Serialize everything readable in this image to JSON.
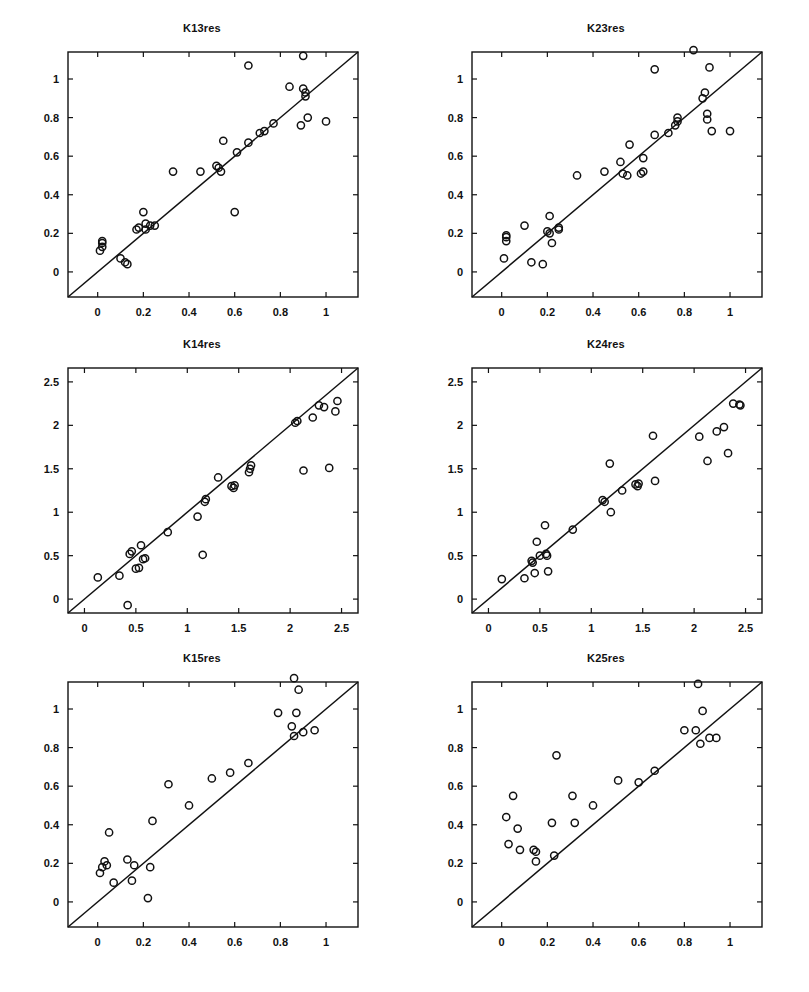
{
  "figure": {
    "width": 809,
    "height": 992,
    "background": "#ffffff",
    "marker_color": "#111111",
    "line_color": "#111111",
    "axis_color": "#111111",
    "rows": 3,
    "cols": 2
  },
  "chart_data": [
    {
      "type": "scatter",
      "title": "K13res",
      "xlabel": "",
      "ylabel": "",
      "xlim": [
        -0.13,
        1.14
      ],
      "ylim": [
        -0.13,
        1.14
      ],
      "xticks": [
        0,
        0.2,
        0.4,
        0.6,
        0.8,
        1
      ],
      "xticklabels": [
        "0",
        "0.2",
        "0.4",
        "0.6",
        "0.8",
        "1"
      ],
      "yticks": [
        0,
        0.2,
        0.4,
        0.6,
        0.8,
        1
      ],
      "yticklabels": [
        "0",
        "0.2",
        "0.4",
        "0.6",
        "0.8",
        "1"
      ],
      "grid": false,
      "legend": null,
      "reference_line": {
        "type": "identity",
        "from": [
          -0.13,
          -0.13
        ],
        "to": [
          1.14,
          1.14
        ]
      },
      "x": [
        0.01,
        0.02,
        0.02,
        0.02,
        0.1,
        0.12,
        0.13,
        0.17,
        0.18,
        0.2,
        0.21,
        0.21,
        0.23,
        0.25,
        0.33,
        0.45,
        0.52,
        0.53,
        0.54,
        0.55,
        0.6,
        0.61,
        0.66,
        0.66,
        0.71,
        0.73,
        0.77,
        0.84,
        0.89,
        0.9,
        0.9,
        0.91,
        0.91,
        0.92,
        1.0
      ],
      "y": [
        0.11,
        0.13,
        0.15,
        0.16,
        0.07,
        0.05,
        0.04,
        0.22,
        0.23,
        0.31,
        0.22,
        0.25,
        0.24,
        0.24,
        0.52,
        0.52,
        0.55,
        0.54,
        0.52,
        0.68,
        0.31,
        0.62,
        1.07,
        0.67,
        0.72,
        0.73,
        0.77,
        0.96,
        0.76,
        1.12,
        0.95,
        0.93,
        0.91,
        0.8,
        0.78
      ]
    },
    {
      "type": "scatter",
      "title": "K23res",
      "xlabel": "",
      "ylabel": "",
      "xlim": [
        -0.13,
        1.14
      ],
      "ylim": [
        -0.13,
        1.14
      ],
      "xticks": [
        0,
        0.2,
        0.4,
        0.6,
        0.8,
        1
      ],
      "xticklabels": [
        "0",
        "0.2",
        "0.4",
        "0.6",
        "0.8",
        "1"
      ],
      "yticks": [
        0,
        0.2,
        0.4,
        0.6,
        0.8,
        1
      ],
      "yticklabels": [
        "0",
        "0.2",
        "0.4",
        "0.6",
        "0.8",
        "1"
      ],
      "grid": false,
      "legend": null,
      "reference_line": {
        "type": "identity",
        "from": [
          -0.13,
          -0.13
        ],
        "to": [
          1.14,
          1.14
        ]
      },
      "x": [
        0.01,
        0.02,
        0.02,
        0.02,
        0.1,
        0.13,
        0.18,
        0.2,
        0.21,
        0.21,
        0.22,
        0.25,
        0.25,
        0.33,
        0.45,
        0.52,
        0.53,
        0.55,
        0.56,
        0.61,
        0.62,
        0.62,
        0.67,
        0.67,
        0.73,
        0.76,
        0.77,
        0.77,
        0.84,
        0.88,
        0.89,
        0.9,
        0.9,
        0.91,
        0.92,
        1.0
      ],
      "y": [
        0.07,
        0.16,
        0.18,
        0.19,
        0.24,
        0.05,
        0.04,
        0.21,
        0.2,
        0.29,
        0.15,
        0.23,
        0.22,
        0.5,
        0.52,
        0.57,
        0.51,
        0.5,
        0.66,
        0.51,
        0.59,
        0.52,
        1.05,
        0.71,
        0.72,
        0.76,
        0.8,
        0.78,
        1.15,
        0.9,
        0.93,
        0.82,
        0.79,
        1.06,
        0.73,
        0.73
      ]
    },
    {
      "type": "scatter",
      "title": "K14res",
      "xlabel": "",
      "ylabel": "",
      "xlim": [
        -0.16,
        2.66
      ],
      "ylim": [
        -0.16,
        2.66
      ],
      "xticks": [
        0,
        0.5,
        1,
        1.5,
        2,
        2.5
      ],
      "xticklabels": [
        "0",
        "0.5",
        "1",
        "1.5",
        "2",
        "2.5"
      ],
      "yticks": [
        0,
        0.5,
        1,
        1.5,
        2,
        2.5
      ],
      "yticklabels": [
        "0",
        "0.5",
        "1",
        "1.5",
        "2",
        "2.5"
      ],
      "grid": false,
      "legend": null,
      "reference_line": {
        "type": "identity",
        "from": [
          -0.16,
          -0.16
        ],
        "to": [
          2.66,
          2.66
        ]
      },
      "x": [
        0.13,
        0.34,
        0.42,
        0.44,
        0.46,
        0.5,
        0.53,
        0.55,
        0.57,
        0.59,
        0.81,
        1.1,
        1.15,
        1.17,
        1.18,
        1.3,
        1.43,
        1.45,
        1.46,
        1.6,
        1.61,
        1.62,
        2.05,
        2.07,
        2.13,
        2.22,
        2.28,
        2.33,
        2.38,
        2.44,
        2.46
      ],
      "y": [
        0.25,
        0.27,
        -0.07,
        0.52,
        0.55,
        0.35,
        0.36,
        0.62,
        0.46,
        0.47,
        0.77,
        0.95,
        0.51,
        1.12,
        1.15,
        1.4,
        1.3,
        1.28,
        1.31,
        1.46,
        1.5,
        1.54,
        2.03,
        2.05,
        1.48,
        2.09,
        2.23,
        2.21,
        1.51,
        2.16,
        2.28
      ]
    },
    {
      "type": "scatter",
      "title": "K24res",
      "xlabel": "",
      "ylabel": "",
      "xlim": [
        -0.16,
        2.66
      ],
      "ylim": [
        -0.16,
        2.66
      ],
      "xticks": [
        0,
        0.5,
        1,
        1.5,
        2,
        2.5
      ],
      "xticklabels": [
        "0",
        "0.5",
        "1",
        "1.5",
        "2",
        "2.5"
      ],
      "yticks": [
        0,
        0.5,
        1,
        1.5,
        2,
        2.5
      ],
      "yticklabels": [
        "0",
        "0.5",
        "1",
        "1.5",
        "2",
        "2.5"
      ],
      "grid": false,
      "legend": null,
      "reference_line": {
        "type": "identity",
        "from": [
          -0.16,
          -0.16
        ],
        "to": [
          2.66,
          2.66
        ]
      },
      "x": [
        0.13,
        0.35,
        0.42,
        0.43,
        0.45,
        0.47,
        0.5,
        0.55,
        0.56,
        0.57,
        0.58,
        0.82,
        1.11,
        1.13,
        1.18,
        1.19,
        1.3,
        1.43,
        1.45,
        1.46,
        1.6,
        1.62,
        2.05,
        2.13,
        2.22,
        2.29,
        2.33,
        2.38,
        2.44,
        2.45
      ],
      "y": [
        0.23,
        0.24,
        0.44,
        0.42,
        0.3,
        0.66,
        0.5,
        0.85,
        0.52,
        0.5,
        0.32,
        0.8,
        1.14,
        1.12,
        1.56,
        1.0,
        1.25,
        1.32,
        1.3,
        1.33,
        1.88,
        1.36,
        1.87,
        1.59,
        1.93,
        1.98,
        1.68,
        2.25,
        2.24,
        2.23
      ]
    },
    {
      "type": "scatter",
      "title": "K15res",
      "xlabel": "",
      "ylabel": "",
      "xlim": [
        -0.13,
        1.14
      ],
      "ylim": [
        -0.13,
        1.14
      ],
      "xticks": [
        0,
        0.2,
        0.4,
        0.6,
        0.8,
        1
      ],
      "xticklabels": [
        "0",
        "0.2",
        "0.4",
        "0.6",
        "0.8",
        "1"
      ],
      "yticks": [
        0,
        0.2,
        0.4,
        0.6,
        0.8,
        1
      ],
      "yticklabels": [
        "0",
        "0.2",
        "0.4",
        "0.6",
        "0.8",
        "1"
      ],
      "grid": false,
      "legend": null,
      "reference_line": {
        "type": "identity",
        "from": [
          -0.13,
          -0.13
        ],
        "to": [
          1.14,
          1.14
        ]
      },
      "x": [
        0.01,
        0.02,
        0.03,
        0.04,
        0.05,
        0.07,
        0.13,
        0.15,
        0.16,
        0.22,
        0.23,
        0.24,
        0.31,
        0.4,
        0.5,
        0.58,
        0.66,
        0.79,
        0.85,
        0.86,
        0.86,
        0.87,
        0.88,
        0.9,
        0.95
      ],
      "y": [
        0.15,
        0.18,
        0.21,
        0.19,
        0.36,
        0.1,
        0.22,
        0.11,
        0.19,
        0.02,
        0.18,
        0.42,
        0.61,
        0.5,
        0.64,
        0.67,
        0.72,
        0.98,
        0.91,
        0.86,
        1.16,
        0.98,
        1.1,
        0.88,
        0.89
      ]
    },
    {
      "type": "scatter",
      "title": "K25res",
      "xlabel": "",
      "ylabel": "",
      "xlim": [
        -0.13,
        1.14
      ],
      "ylim": [
        -0.13,
        1.14
      ],
      "xticks": [
        0,
        0.2,
        0.4,
        0.6,
        0.8,
        1
      ],
      "xticklabels": [
        "0",
        "0.2",
        "0.4",
        "0.6",
        "0.8",
        "1"
      ],
      "yticks": [
        0,
        0.2,
        0.4,
        0.6,
        0.8,
        1
      ],
      "yticklabels": [
        "0",
        "0.2",
        "0.4",
        "0.6",
        "0.8",
        "1"
      ],
      "grid": false,
      "legend": null,
      "reference_line": {
        "type": "identity",
        "from": [
          -0.13,
          -0.13
        ],
        "to": [
          1.14,
          1.14
        ]
      },
      "x": [
        0.02,
        0.03,
        0.05,
        0.07,
        0.08,
        0.14,
        0.15,
        0.15,
        0.22,
        0.23,
        0.24,
        0.31,
        0.32,
        0.4,
        0.51,
        0.6,
        0.67,
        0.8,
        0.85,
        0.86,
        0.87,
        0.88,
        0.91,
        0.94
      ],
      "y": [
        0.44,
        0.3,
        0.55,
        0.38,
        0.27,
        0.27,
        0.21,
        0.26,
        0.41,
        0.24,
        0.76,
        0.55,
        0.41,
        0.5,
        0.63,
        0.62,
        0.68,
        0.89,
        0.89,
        1.13,
        0.82,
        0.99,
        0.85,
        0.85
      ]
    }
  ]
}
